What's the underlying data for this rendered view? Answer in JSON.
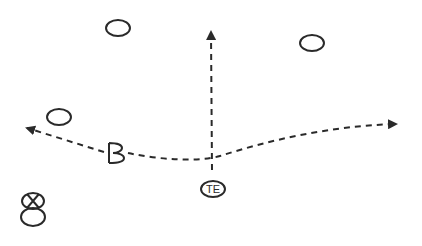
{
  "diagram": {
    "type": "football-play",
    "colors": {
      "ink": "#2a2a2a",
      "background": "#ffffff"
    },
    "players": [
      {
        "id": "o1",
        "shape": "circle",
        "label": "",
        "x": 118,
        "y": 28
      },
      {
        "id": "o2",
        "shape": "circle",
        "label": "",
        "x": 312,
        "y": 43
      },
      {
        "id": "o3",
        "shape": "circle",
        "label": "",
        "x": 59,
        "y": 117
      },
      {
        "id": "b",
        "shape": "letter",
        "label": "B",
        "x": 115,
        "y": 152
      },
      {
        "id": "te",
        "shape": "circle-labeled",
        "label": "TE",
        "x": 213,
        "y": 189
      },
      {
        "id": "qb",
        "shape": "x-over-circle",
        "label": "X",
        "x": 33,
        "y": 208
      }
    ],
    "routes": [
      {
        "from": "te",
        "description": "vertical dashed route upward",
        "end": [
          210,
          30
        ]
      },
      {
        "from": "b",
        "description": "dashed route to left flat",
        "end": [
          25,
          128
        ]
      },
      {
        "from": "b",
        "description": "dashed crossing route curving to right",
        "end": [
          398,
          124
        ]
      }
    ]
  }
}
